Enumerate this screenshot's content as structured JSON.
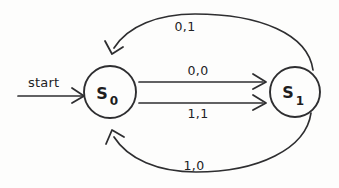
{
  "diagram": {
    "kind": "finite-state-machine",
    "background_color": "#fdfdfc",
    "stroke_color": "#2e2e30",
    "text_color": "#222224",
    "start_label": "start",
    "states": [
      {
        "id": "s0",
        "letter": "S",
        "subscript": "0",
        "cx": 110,
        "cy": 92,
        "r": 26
      },
      {
        "id": "s1",
        "letter": "S",
        "subscript": "1",
        "cx": 295,
        "cy": 92,
        "r": 25
      }
    ],
    "transitions": [
      {
        "id": "t-top",
        "label": "0,1",
        "from": "s1",
        "to": "s0",
        "shape": "arc-above",
        "label_x": 185,
        "label_y": 31
      },
      {
        "id": "t-upper",
        "label": "0,0",
        "from": "s0",
        "to": "s1",
        "shape": "straight",
        "label_x": 198,
        "label_y": 75
      },
      {
        "id": "t-lower",
        "label": "1,1",
        "from": "s0",
        "to": "s1",
        "shape": "straight",
        "label_x": 198,
        "label_y": 118
      },
      {
        "id": "t-bottom",
        "label": "1,0",
        "from": "s1",
        "to": "s0",
        "shape": "arc-below",
        "label_x": 194,
        "label_y": 170
      }
    ]
  }
}
